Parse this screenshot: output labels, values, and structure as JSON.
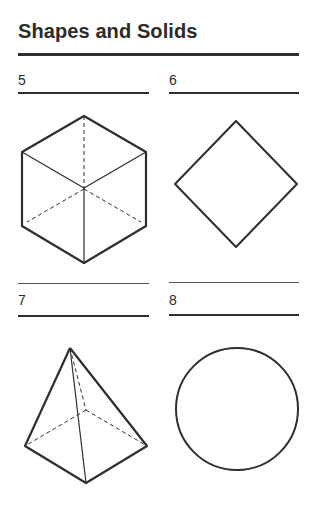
{
  "page": {
    "title": "Shapes and Solids"
  },
  "items": [
    {
      "number": "5",
      "figure": "cube",
      "description": "Cube drawn in isometric view with hidden edges dashed"
    },
    {
      "number": "6",
      "figure": "square",
      "description": "Square rotated 45 degrees (diamond)"
    },
    {
      "number": "7",
      "figure": "square-pyramid",
      "description": "Square-based pyramid with hidden edges dashed"
    },
    {
      "number": "8",
      "figure": "circle",
      "description": "Circle"
    }
  ],
  "colors": {
    "ink": "#2e2e2e",
    "background": "#ffffff"
  }
}
